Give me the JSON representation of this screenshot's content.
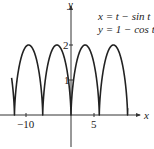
{
  "chart_data": {
    "type": "line",
    "title": "",
    "annotation": [
      "x = t − sin t",
      "y = 1 − cos t"
    ],
    "xlabel": "x",
    "ylabel": "y",
    "xticks": [
      -10,
      5
    ],
    "yticks": [
      1,
      2
    ],
    "xlim": [
      -15,
      16
    ],
    "ylim": [
      -0.9,
      3.2
    ],
    "grid": false,
    "legend": "none",
    "series": [
      {
        "name": "cycloid",
        "parametric": {
          "x": "t - sin t",
          "y": "1 - cos t"
        },
        "t_range": [
          -14.2,
          13.2
        ],
        "cusps_x": [
          -12.566,
          -6.283,
          0,
          6.283,
          12.566
        ],
        "peaks": [
          [
            -9.425,
            2
          ],
          [
            -3.142,
            2
          ],
          [
            3.142,
            2
          ],
          [
            9.425,
            2
          ]
        ]
      }
    ],
    "color": "#222222"
  },
  "labels": {
    "x_axis": "x",
    "y_axis": "y",
    "tick_x_neg10": "−10",
    "tick_x_5": "5",
    "tick_y_1": "1",
    "tick_y_2": "2",
    "eq1": "x = t − sin t",
    "eq2": "y = 1 − cos t"
  }
}
